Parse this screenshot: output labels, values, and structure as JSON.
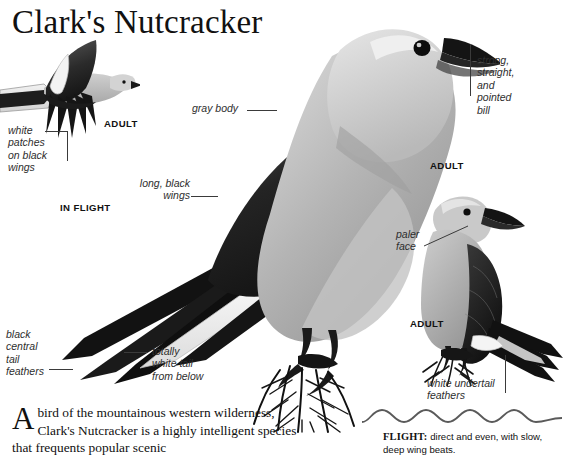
{
  "page": {
    "title": "Clark's Nutcracker",
    "background_color": "#ffffff",
    "text_color": "#111111"
  },
  "labels": {
    "white_patches": "white\npatches\non black\nwings",
    "gray_body": "gray body",
    "long_black_wings": "long, black\nwings",
    "strong_bill": "strong,\nstraight,\nand\npointed\nbill",
    "paler_face": "paler\nface",
    "black_central_tail": "black\ncentral\ntail\nfeathers",
    "totally_white_tail": "totally\nwhite tail\nfrom below",
    "white_undertail": "white undertail\nfeathers"
  },
  "captions": {
    "adult_flight": "ADULT",
    "in_flight": "IN FLIGHT",
    "adult_main": "ADULT",
    "adult_small": "ADULT"
  },
  "body": {
    "dropcap": "A",
    "paragraph": "bird of the mountainous western wilderness, Clark's Nutcracker is a highly intelligent species that frequents popular scenic"
  },
  "flight": {
    "heading": "FLIGHT:",
    "text": " direct and even, with slow, deep wing beats."
  }
}
